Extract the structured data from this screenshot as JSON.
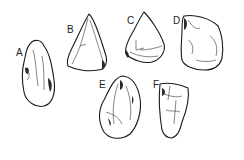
{
  "figure": {
    "artifacts": [
      {
        "id": "A",
        "label": "A"
      },
      {
        "id": "B",
        "label": "B"
      },
      {
        "id": "C",
        "label": "C"
      },
      {
        "id": "D",
        "label": "D"
      },
      {
        "id": "E",
        "label": "E"
      },
      {
        "id": "F",
        "label": "F"
      }
    ]
  }
}
